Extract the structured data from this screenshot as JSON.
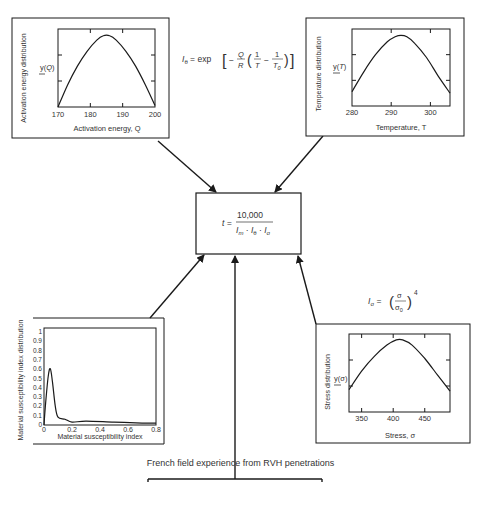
{
  "activation_panel": {
    "y_title": "Activation energy distribution",
    "x_title": "Activation energy, Q",
    "y_label": "y(Q)",
    "x_ticks": [
      "170",
      "180",
      "190",
      "200"
    ]
  },
  "temperature_panel": {
    "y_title": "Temperature distribution",
    "x_title": "Temperature, T",
    "y_label": "y(T)",
    "x_ticks": [
      "280",
      "290",
      "300"
    ]
  },
  "material_panel": {
    "y_title": "Material susceptibility index distribution",
    "x_title": "Material susceptibility index",
    "y_ticks": [
      "0",
      "0.1",
      "0.2",
      "0.3",
      "0.4",
      "0.5",
      "0.6",
      "0.7",
      "0.8",
      "0.9",
      "1"
    ],
    "x_ticks": [
      "0",
      "0.2",
      "0.4",
      "0.6",
      "0.8"
    ]
  },
  "stress_panel": {
    "y_title": "Stress distribution",
    "x_title": "Stress, σ",
    "y_label": "y(σ)",
    "x_ticks": [
      "350",
      "400",
      "450"
    ]
  },
  "formulas": {
    "i_theta": "I_θ = exp[ −(Q/R)(1/T − 1/T₀) ]",
    "i_sigma": "I_σ = (σ/σ₀)⁴",
    "time": "t = 10,000 / (I_m · I_θ · I_σ)",
    "time_lhs": "t =",
    "time_numerator": "10,000"
  },
  "caption": "French field experience from RVH penetrations",
  "chart_data": [
    {
      "type": "line",
      "title": "Activation energy distribution",
      "xlabel": "Activation energy, Q",
      "ylabel": "y(Q)",
      "xlim": [
        170,
        200
      ],
      "x": [
        170,
        173,
        176,
        179,
        182,
        184,
        186,
        188,
        191,
        194,
        197,
        200
      ],
      "y": [
        0.0,
        0.3,
        0.55,
        0.75,
        0.9,
        0.96,
        0.96,
        0.9,
        0.75,
        0.55,
        0.3,
        0.02
      ]
    },
    {
      "type": "line",
      "title": "Temperature distribution",
      "xlabel": "Temperature, T",
      "ylabel": "y(T)",
      "xlim": [
        280,
        305
      ],
      "x": [
        280,
        283,
        286,
        289,
        291,
        292.5,
        294,
        296,
        299,
        302,
        305
      ],
      "y": [
        0.2,
        0.48,
        0.72,
        0.9,
        0.97,
        0.99,
        0.97,
        0.88,
        0.68,
        0.42,
        0.18
      ]
    },
    {
      "type": "line",
      "title": "Material susceptibility index distribution",
      "xlabel": "Material susceptibility index",
      "ylabel": "Material susceptibility index distribution",
      "xlim": [
        0,
        0.8
      ],
      "ylim": [
        0,
        1
      ],
      "x": [
        0,
        0.01,
        0.03,
        0.045,
        0.06,
        0.08,
        0.1,
        0.15,
        0.2,
        0.3,
        0.5,
        0.7,
        0.8
      ],
      "y": [
        0.0,
        0.2,
        0.5,
        0.58,
        0.45,
        0.2,
        0.08,
        0.06,
        0.03,
        0.04,
        0.03,
        0.02,
        0.02
      ]
    },
    {
      "type": "line",
      "title": "Stress distribution",
      "xlabel": "Stress, σ",
      "ylabel": "y(σ)",
      "xlim": [
        330,
        490
      ],
      "x": [
        330,
        350,
        370,
        390,
        405,
        415,
        430,
        450,
        470,
        490
      ],
      "y": [
        0.3,
        0.55,
        0.75,
        0.9,
        0.97,
        0.97,
        0.9,
        0.72,
        0.5,
        0.28
      ]
    }
  ]
}
